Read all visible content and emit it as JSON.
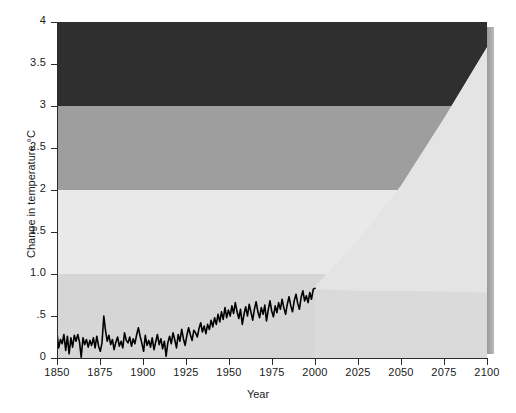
{
  "chart_data": {
    "type": "area",
    "title": "",
    "xlabel": "Year",
    "ylabel": "Change in temperature °C",
    "xlim": [
      1850,
      2100
    ],
    "ylim": [
      0,
      4
    ],
    "grid": false,
    "legend": "none",
    "x_ticks": [
      1850,
      1875,
      1900,
      1925,
      1950,
      1975,
      2000,
      2025,
      2050,
      2075,
      2100
    ],
    "x_tick_labels": [
      "1850",
      "1875",
      "1900",
      "1925",
      "1950",
      "1975",
      "2000",
      "2025",
      "2050",
      "2075",
      "2100"
    ],
    "y_ticks": [
      0,
      0.5,
      1.0,
      1.5,
      2.0,
      2.5,
      3.0,
      3.5,
      4.0
    ],
    "y_tick_labels": [
      "0",
      ".5",
      "1.0",
      "1.5",
      "2",
      "2.5",
      "3",
      "3.5",
      "4"
    ],
    "bands": [
      {
        "name": "severe-band",
        "from": 3.0,
        "to": 4.0,
        "color": "#2f2f2f"
      },
      {
        "name": "high-band",
        "from": 2.0,
        "to": 3.0,
        "color": "#9e9e9e"
      },
      {
        "name": "moderate-band",
        "from": 1.0,
        "to": 2.0,
        "color": "#e9e9e9"
      },
      {
        "name": "low-band",
        "from": 0.0,
        "to": 1.0,
        "color": "#d6d6d6"
      }
    ],
    "series": [
      {
        "name": "Observed global temperature anomaly",
        "type": "line",
        "color": "#000000",
        "x_start": 1850,
        "x_end": 2000,
        "values": [
          0.3,
          0.12,
          0.22,
          0.17,
          0.28,
          0.09,
          0.26,
          0.05,
          0.24,
          0.13,
          0.27,
          0.2,
          0.28,
          0.19,
          0.01,
          0.24,
          0.16,
          0.22,
          0.13,
          0.21,
          0.15,
          0.24,
          0.12,
          0.26,
          0.14,
          0.08,
          0.18,
          0.5,
          0.33,
          0.2,
          0.27,
          0.16,
          0.22,
          0.1,
          0.19,
          0.25,
          0.14,
          0.2,
          0.12,
          0.3,
          0.21,
          0.18,
          0.25,
          0.14,
          0.23,
          0.17,
          0.28,
          0.36,
          0.26,
          0.18,
          0.08,
          0.27,
          0.15,
          0.21,
          0.13,
          0.24,
          0.1,
          0.19,
          0.28,
          0.16,
          0.23,
          0.11,
          0.2,
          0.02,
          0.18,
          0.26,
          0.17,
          0.3,
          0.22,
          0.12,
          0.28,
          0.2,
          0.34,
          0.23,
          0.15,
          0.27,
          0.36,
          0.28,
          0.21,
          0.33,
          0.3,
          0.25,
          0.35,
          0.42,
          0.31,
          0.38,
          0.29,
          0.4,
          0.34,
          0.45,
          0.37,
          0.48,
          0.4,
          0.52,
          0.43,
          0.55,
          0.46,
          0.6,
          0.48,
          0.57,
          0.5,
          0.62,
          0.53,
          0.66,
          0.55,
          0.47,
          0.58,
          0.4,
          0.52,
          0.61,
          0.5,
          0.64,
          0.55,
          0.45,
          0.58,
          0.67,
          0.55,
          0.48,
          0.6,
          0.52,
          0.63,
          0.44,
          0.57,
          0.68,
          0.56,
          0.49,
          0.62,
          0.54,
          0.66,
          0.58,
          0.7,
          0.6,
          0.52,
          0.64,
          0.73,
          0.62,
          0.55,
          0.68,
          0.76,
          0.65,
          0.58,
          0.72,
          0.8,
          0.68,
          0.74,
          0.66,
          0.78,
          0.7,
          0.82,
          0.83
        ]
      },
      {
        "name": "Projection upper bound",
        "type": "envelope-upper",
        "x": [
          2000,
          2025,
          2050,
          2075,
          2100
        ],
        "values": [
          0.85,
          1.4,
          2.05,
          2.85,
          3.7
        ]
      },
      {
        "name": "Projection lower bound",
        "type": "envelope-lower",
        "x": [
          2000,
          2025,
          2050,
          2075,
          2100
        ],
        "values": [
          0.82,
          0.8,
          0.8,
          0.79,
          0.78
        ]
      }
    ]
  },
  "axes": {
    "x_title": "Year",
    "y_title": "Change in temperature °C"
  },
  "colors": {
    "severe": "#2f2f2f",
    "high": "#9e9e9e",
    "moderate": "#e9e9e9",
    "low": "#d6d6d6",
    "line": "#000000",
    "axis": "#2b2b2b",
    "bevel": "#a5a5a5"
  }
}
